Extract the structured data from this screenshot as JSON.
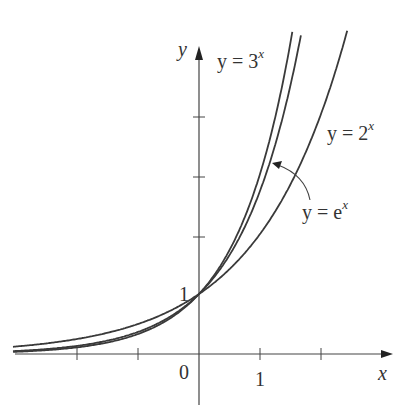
{
  "chart_data": {
    "type": "line",
    "title": "",
    "xlabel": "x",
    "ylabel": "y",
    "xlim": [
      -3.0,
      3.1
    ],
    "ylim": [
      -0.7,
      5.3
    ],
    "x_ticks": [
      -2,
      -1,
      0,
      1,
      2
    ],
    "x_tick_labels": [
      "0",
      "1"
    ],
    "y_ticks": [
      1,
      2,
      3,
      4
    ],
    "y_tick_labels": [
      "1"
    ],
    "grid": false,
    "series": [
      {
        "name": "y = 3^x",
        "base": 3
      },
      {
        "name": "y = e^x",
        "base": 2.718281828
      },
      {
        "name": "y = 2^x",
        "base": 2
      }
    ],
    "annotations": [
      {
        "text": "y = 3^x",
        "position": "top, right of y-axis"
      },
      {
        "text": "y = 2^x",
        "position": "right of 2^x curve"
      },
      {
        "text": "y = e^x",
        "position": "with curved arrow pointing to e^x curve"
      }
    ],
    "intersection": {
      "x": 0,
      "y": 1
    }
  },
  "labels": {
    "y_axis": "y",
    "x_axis": "x",
    "origin": "0",
    "x_one": "1",
    "y_one": "1",
    "three_prefix": "y = 3",
    "three_exp": "x",
    "two_prefix": "y = 2",
    "two_exp": "x",
    "e_prefix": "y = e",
    "e_exp": "x"
  },
  "colors": {
    "curve": "#3a3a3a",
    "axis": "#444444",
    "text": "#333333"
  }
}
